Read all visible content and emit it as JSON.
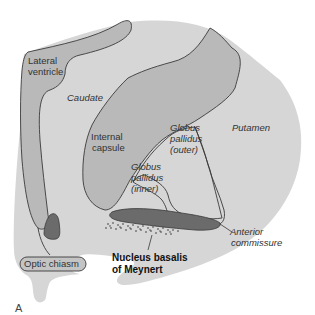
{
  "figure": {
    "panel_label": "A",
    "colors": {
      "background": "#ffffff",
      "brain_fill": "#d6d6d6",
      "darker_region_fill": "#b9b9b9",
      "dark_structure_fill": "#6b6b6b",
      "outline": "#3a3a3a",
      "text": "#333333"
    },
    "labels": {
      "lateral_ventricle": [
        "Lateral",
        "ventricle"
      ],
      "caudate": "Caudate",
      "internal_capsule": [
        "Internal",
        "capsule"
      ],
      "globus_pallidus_outer": [
        "Globus",
        "pallidus",
        "(outer)"
      ],
      "putamen": "Putamen",
      "globus_pallidus_inner": [
        "Globus",
        "pallidus",
        "(inner)"
      ],
      "anterior_commissure": [
        "Anterior",
        "commissure"
      ],
      "optic_chiasm": "Optic chiasm",
      "nucleus_basalis": [
        "Nucleus basalis",
        "of Meynert"
      ]
    }
  }
}
